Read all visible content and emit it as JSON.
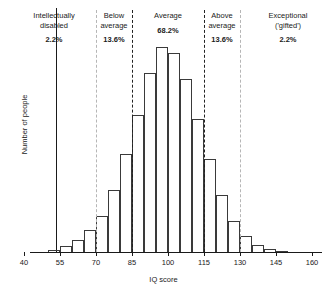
{
  "chart_data": {
    "type": "bar",
    "title": "",
    "xlabel": "IQ score",
    "ylabel": "Number of people",
    "xlim": [
      35,
      170
    ],
    "ylim": [
      0,
      1.0
    ],
    "grid": false,
    "legend": null,
    "bin_width": 5,
    "categories": [
      "50",
      "55",
      "60",
      "65",
      "70",
      "75",
      "80",
      "85",
      "90",
      "95",
      "100",
      "105",
      "110",
      "115",
      "120",
      "125",
      "130",
      "135",
      "140",
      "145"
    ],
    "bin_starts": [
      50,
      55,
      60,
      65,
      70,
      75,
      80,
      85,
      90,
      95,
      100,
      105,
      110,
      115,
      120,
      125,
      130,
      135,
      140,
      145
    ],
    "values": [
      0.012,
      0.03,
      0.06,
      0.105,
      0.175,
      0.3,
      0.47,
      0.66,
      0.86,
      0.985,
      0.955,
      0.83,
      0.64,
      0.445,
      0.275,
      0.15,
      0.075,
      0.035,
      0.015,
      0.006
    ],
    "tick_values": [
      40,
      55,
      70,
      85,
      100,
      115,
      130,
      145,
      160
    ],
    "tick_labels": [
      "40",
      "55",
      "70",
      "85",
      "100",
      "115",
      "130",
      "145",
      "160"
    ],
    "dividers": [
      {
        "at": 70,
        "style": "dashed",
        "color": "#b6b6b6"
      },
      {
        "at": 85,
        "style": "dashed",
        "color": "#222222"
      },
      {
        "at": 115,
        "style": "dashed",
        "color": "#222222"
      },
      {
        "at": 130,
        "style": "dashed",
        "color": "#b6b6b6"
      }
    ],
    "annotations": [
      {
        "name": "Intellectually\ndisabled",
        "percent": "2.2%",
        "range": [
          35,
          70
        ]
      },
      {
        "name": "Below\naverage",
        "percent": "13.6%",
        "range": [
          70,
          85
        ]
      },
      {
        "name": "Average",
        "percent": "68.2%",
        "range": [
          85,
          115
        ]
      },
      {
        "name": "Above\naverage",
        "percent": "13.6%",
        "range": [
          115,
          130
        ]
      },
      {
        "name": "Exceptional\n('gifted')",
        "percent": "2.2%",
        "range": [
          130,
          170
        ]
      }
    ]
  },
  "axes": {
    "x_title": "IQ score",
    "y_title": "Number of people"
  },
  "colors": {
    "bar_stroke": "#3a3a3a",
    "axis": "#1a1a1a",
    "divider_gray": "#b6b6b6",
    "divider_black": "#222222",
    "background": "#ffffff"
  }
}
